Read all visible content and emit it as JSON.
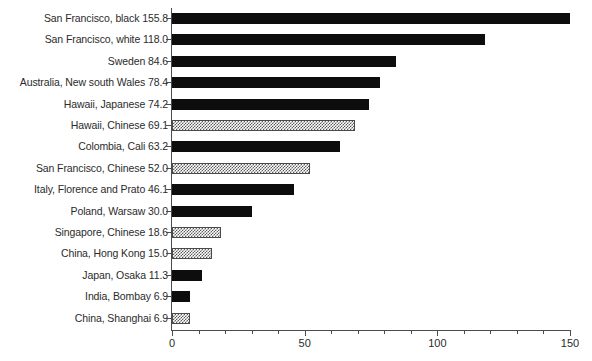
{
  "chart_data": {
    "type": "bar",
    "orientation": "horizontal",
    "title": "",
    "subtitle": "",
    "xlabel": "",
    "ylabel": "",
    "xlim": [
      0,
      150
    ],
    "grid": false,
    "legend": null,
    "x_major_ticks": [
      0,
      50,
      100,
      150
    ],
    "x_minor_tick_step": 10,
    "x_tick_labels": [
      "0",
      "50",
      "100",
      "150"
    ],
    "categories": [
      "San Francisco, black",
      "San Francisco, white",
      "Sweden",
      "Australia, New south Wales",
      "Hawaii, Japanese",
      "Hawaii, Chinese",
      "Colombia, Cali",
      "San Francisco, Chinese",
      "Italy, Florence and Prato",
      "Poland, Warsaw",
      "Singapore, Chinese",
      "China, Hong Kong",
      "Japan, Osaka",
      "India, Bombay",
      "China, Shanghai"
    ],
    "values": [
      155.8,
      118.0,
      84.6,
      78.4,
      74.2,
      69.1,
      63.2,
      52.0,
      46.1,
      30.0,
      18.6,
      15.0,
      11.3,
      6.9,
      6.9
    ],
    "fills": [
      "solid",
      "solid",
      "solid",
      "solid",
      "solid",
      "hatch",
      "solid",
      "hatch",
      "solid",
      "solid",
      "hatch",
      "hatch",
      "solid",
      "solid",
      "hatch"
    ],
    "rows": [
      {
        "label": "San Francisco, black 155.8",
        "category": "San Francisco, black",
        "value": 155.8,
        "fill": "solid"
      },
      {
        "label": "San Francisco, white 118.0",
        "category": "San Francisco, white",
        "value": 118.0,
        "fill": "solid"
      },
      {
        "label": "Sweden 84.6",
        "category": "Sweden",
        "value": 84.6,
        "fill": "solid"
      },
      {
        "label": "Australia, New south Wales 78.4",
        "category": "Australia, New south Wales",
        "value": 78.4,
        "fill": "solid"
      },
      {
        "label": "Hawaii, Japanese 74.2",
        "category": "Hawaii, Japanese",
        "value": 74.2,
        "fill": "solid"
      },
      {
        "label": "Hawaii, Chinese 69.1",
        "category": "Hawaii, Chinese",
        "value": 69.1,
        "fill": "hatch"
      },
      {
        "label": "Colombia, Cali 63.2",
        "category": "Colombia, Cali",
        "value": 63.2,
        "fill": "solid"
      },
      {
        "label": "San Francisco, Chinese 52.0",
        "category": "San Francisco, Chinese",
        "value": 52.0,
        "fill": "hatch"
      },
      {
        "label": "Italy, Florence and Prato 46.1",
        "category": "Italy, Florence and Prato",
        "value": 46.1,
        "fill": "solid"
      },
      {
        "label": "Poland, Warsaw 30.0",
        "category": "Poland, Warsaw",
        "value": 30.0,
        "fill": "solid"
      },
      {
        "label": "Singapore, Chinese 18.6",
        "category": "Singapore, Chinese",
        "value": 18.6,
        "fill": "hatch"
      },
      {
        "label": "China, Hong Kong 15.0",
        "category": "China, Hong Kong",
        "value": 15.0,
        "fill": "hatch"
      },
      {
        "label": "Japan, Osaka 11.3",
        "category": "Japan, Osaka",
        "value": 11.3,
        "fill": "solid"
      },
      {
        "label": "India, Bombay 6.9",
        "category": "India, Bombay",
        "value": 6.9,
        "fill": "solid"
      },
      {
        "label": "China, Shanghai 6.9",
        "category": "China, Shanghai",
        "value": 6.9,
        "fill": "hatch"
      }
    ],
    "colors": {
      "solid_bar": "#0d0d0d",
      "hatch_bar": "#5d5d5d",
      "axis": "#4c4c4c",
      "text": "#2b2b2b",
      "background": "#ffffff"
    }
  }
}
